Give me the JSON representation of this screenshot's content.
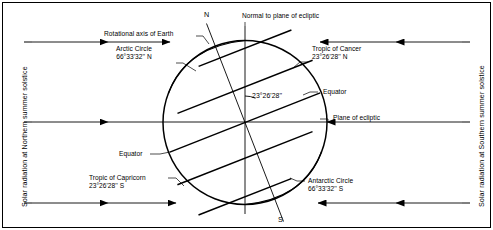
{
  "diagram": {
    "obliquity_angle": "23°26'28''",
    "labels": {
      "rotational_axis": "Rotational axis of Earth",
      "normal_to_ecliptic": "Normal to plane of ecliptic",
      "arctic_circle_name": "Arctic Circle",
      "arctic_circle_value": "66°33'32'' N",
      "tropic_cancer_name": "Tropic of Cancer",
      "tropic_cancer_value": "23°26'28'' N",
      "equator_upper": "Equator",
      "equator_lower": "Equator",
      "plane_of_ecliptic": "Plane of ecliptic",
      "tropic_capricorn_name": "Tropic of Capricorn",
      "tropic_capricorn_value": "23°26'28'' S",
      "antarctic_circle_name": "Antarctic Circle",
      "antarctic_circle_value": "66°33'32'' S",
      "pole_north": "N",
      "pole_south": "S",
      "left_side": "Solar radiation at Northern summer solstice",
      "right_side": "Solar radiation at Southern summer solstice"
    },
    "colors": {
      "ink": "#000000",
      "background": "#ffffff",
      "border": "#000000"
    }
  }
}
